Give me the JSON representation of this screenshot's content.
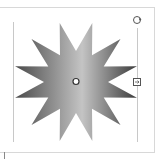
{
  "editor": {
    "selected_shape": {
      "type": "12-point-star",
      "points": 12,
      "fill": "linear-gradient",
      "gradient_colors": [
        "#4a4a4a",
        "#c8c8c8",
        "#4a4a4a"
      ]
    },
    "handles": {
      "rotate": "rotate-handle",
      "resize": "resize-handle",
      "center": "center-handle"
    },
    "colors": {
      "guide": "#c8c8c8",
      "frame": "#d8d8d8",
      "handle_stroke": "#555555"
    }
  }
}
